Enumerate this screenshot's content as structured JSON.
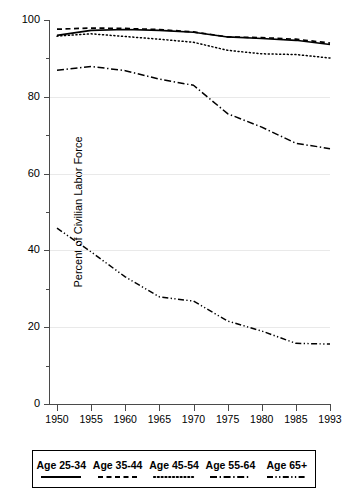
{
  "chart_data": {
    "type": "line",
    "title": "",
    "xlabel": "",
    "ylabel": "Percent of Civilian Labor Force",
    "xlim": [
      1950,
      1993
    ],
    "ylim": [
      0,
      100
    ],
    "grid": true,
    "legend_position": "below",
    "x": [
      1950,
      1955,
      1960,
      1965,
      1970,
      1975,
      1980,
      1985,
      1993
    ],
    "xtick_labels": [
      "1950",
      "1955",
      "1960",
      "1965",
      "1970",
      "1975",
      "1980",
      "1985",
      "1993"
    ],
    "ytick_labels": [
      "0",
      "20",
      "40",
      "60",
      "80",
      "100"
    ],
    "ytick_values": [
      0,
      20,
      40,
      60,
      80,
      100
    ],
    "yminor_values": [
      10,
      30,
      50,
      70,
      90
    ],
    "series": [
      {
        "name": "Age 25-34",
        "style": "solid",
        "color": "#000000",
        "values": [
          96.0,
          97.3,
          97.5,
          97.3,
          96.8,
          95.6,
          95.2,
          94.7,
          93.6
        ]
      },
      {
        "name": "Age 35-44",
        "style": "dashed",
        "color": "#000000",
        "values": [
          97.6,
          97.9,
          97.8,
          97.5,
          96.9,
          95.6,
          95.4,
          95.0,
          94.0
        ]
      },
      {
        "name": "Age 45-54",
        "style": "dotted",
        "color": "#000000",
        "values": [
          95.8,
          96.4,
          95.7,
          95.0,
          94.2,
          92.1,
          91.2,
          91.0,
          90.1
        ]
      },
      {
        "name": "Age 55-64",
        "style": "dashdot",
        "color": "#000000",
        "values": [
          86.9,
          87.9,
          86.8,
          84.6,
          83.0,
          75.6,
          72.1,
          67.9,
          66.5
        ]
      },
      {
        "name": "Age 65+",
        "style": "dashdotdot",
        "color": "#000000",
        "values": [
          45.8,
          39.6,
          33.1,
          27.9,
          26.8,
          21.6,
          19.0,
          15.8,
          15.6
        ]
      }
    ]
  },
  "legend": {
    "entries": [
      {
        "label": "Age 25-34"
      },
      {
        "label": "Age 35-44"
      },
      {
        "label": "Age 45-54"
      },
      {
        "label": "Age 55-64"
      },
      {
        "label": "Age 65+"
      }
    ]
  }
}
